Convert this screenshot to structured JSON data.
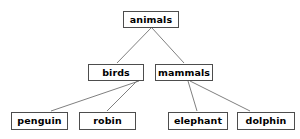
{
  "diagram": {
    "type": "tree-diagram",
    "background_color": "#ffffff",
    "node_border_color": "#4d4d4d",
    "node_fill_color": "#ffffff",
    "node_text_color": "#000000",
    "edge_color": "#808080",
    "nodes": [
      {
        "id": "animals",
        "label": "animals",
        "level": 0,
        "x": 123,
        "y": 11,
        "w": 56,
        "h": 17
      },
      {
        "id": "birds",
        "label": "birds",
        "level": 1,
        "x": 88,
        "y": 64,
        "w": 56,
        "h": 17
      },
      {
        "id": "mammals",
        "label": "mammals",
        "level": 1,
        "x": 155,
        "y": 64,
        "w": 58,
        "h": 17
      },
      {
        "id": "penguin",
        "label": "penguin",
        "level": 2,
        "x": 11,
        "y": 112,
        "w": 57,
        "h": 18
      },
      {
        "id": "robin",
        "label": "robin",
        "level": 2,
        "x": 79,
        "y": 112,
        "w": 57,
        "h": 18
      },
      {
        "id": "elephant",
        "label": "elephant",
        "level": 2,
        "x": 168,
        "y": 112,
        "w": 60,
        "h": 18
      },
      {
        "id": "dolphin",
        "label": "dolphin",
        "level": 2,
        "x": 237,
        "y": 112,
        "w": 58,
        "h": 18
      }
    ],
    "edges": [
      {
        "id": "animals-birds",
        "from": "animals",
        "to": "birds",
        "x1": 151,
        "y1": 28,
        "x2": 117,
        "y2": 63
      },
      {
        "id": "animals-mammals",
        "from": "animals",
        "to": "mammals",
        "x1": 152,
        "y1": 28,
        "x2": 184,
        "y2": 63
      },
      {
        "id": "birds-penguin",
        "from": "birds",
        "to": "penguin",
        "x1": 139,
        "y1": 81,
        "x2": 51,
        "y2": 111
      },
      {
        "id": "birds-robin",
        "from": "birds",
        "to": "robin",
        "x1": 137,
        "y1": 81,
        "x2": 107,
        "y2": 111
      },
      {
        "id": "mammals-elephant",
        "from": "mammals",
        "to": "elephant",
        "x1": 188,
        "y1": 81,
        "x2": 197,
        "y2": 111
      },
      {
        "id": "mammals-dolphin",
        "from": "mammals",
        "to": "dolphin",
        "x1": 190,
        "y1": 81,
        "x2": 250,
        "y2": 111
      }
    ]
  }
}
